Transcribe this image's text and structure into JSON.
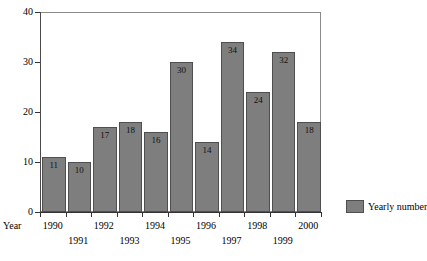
{
  "chart_data": {
    "type": "bar",
    "title": "",
    "xlabel": "Year",
    "ylabel": "",
    "categories": [
      "1990",
      "1991",
      "1992",
      "1993",
      "1994",
      "1995",
      "1996",
      "1997",
      "1998",
      "1999",
      "2000"
    ],
    "values": [
      11,
      10,
      17,
      18,
      16,
      30,
      14,
      34,
      24,
      32,
      18
    ],
    "ylim": [
      0,
      40
    ],
    "yticks": [
      0,
      10,
      20,
      30,
      40
    ],
    "ytick_labels": [
      "0",
      "10",
      "20",
      "30",
      "40"
    ],
    "grid": false,
    "legend": {
      "position": "right",
      "entries": [
        {
          "label": "Yearly number",
          "color": "#7e7e7e"
        }
      ]
    },
    "series": [
      {
        "name": "Yearly number",
        "values": [
          11,
          10,
          17,
          18,
          16,
          30,
          14,
          34,
          24,
          32,
          18
        ]
      }
    ],
    "data_labels": [
      "11",
      "10",
      "17",
      "18",
      "16",
      "30",
      "14",
      "34",
      "24",
      "32",
      "18"
    ],
    "colors": {
      "bar_fill": "#7e7e7e",
      "bar_border": "#4f4f4f",
      "axis": "#333333",
      "frame": "#8a8a8a",
      "background": "#ffffff",
      "text": "#000000"
    }
  }
}
